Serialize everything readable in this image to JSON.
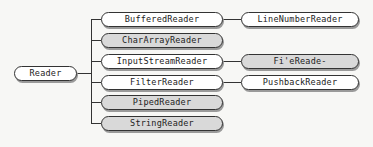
{
  "diagram": {
    "root": {
      "label": "Reader"
    },
    "children": [
      {
        "label": "BufferedReader",
        "style": "white"
      },
      {
        "label": "CharArrayReader",
        "style": "gray"
      },
      {
        "label": "InputStreamReader",
        "style": "white"
      },
      {
        "label": "FilterReader",
        "style": "white"
      },
      {
        "label": "PipedReader",
        "style": "gray"
      },
      {
        "label": "StringReader",
        "style": "gray"
      }
    ],
    "grandchildren": [
      {
        "parent": "BufferedReader",
        "label": "LineNumberReader",
        "style": "white"
      },
      {
        "parent": "InputStreamReader",
        "label": "Fi'eReade-",
        "style": "gray"
      },
      {
        "parent": "FilterReader",
        "label": "PushbackReader",
        "style": "white"
      }
    ],
    "colors": {
      "white_node": "#ffffff",
      "gray_node": "#d9d9d9",
      "line": "#333333",
      "background": "#f7f7f5"
    }
  }
}
